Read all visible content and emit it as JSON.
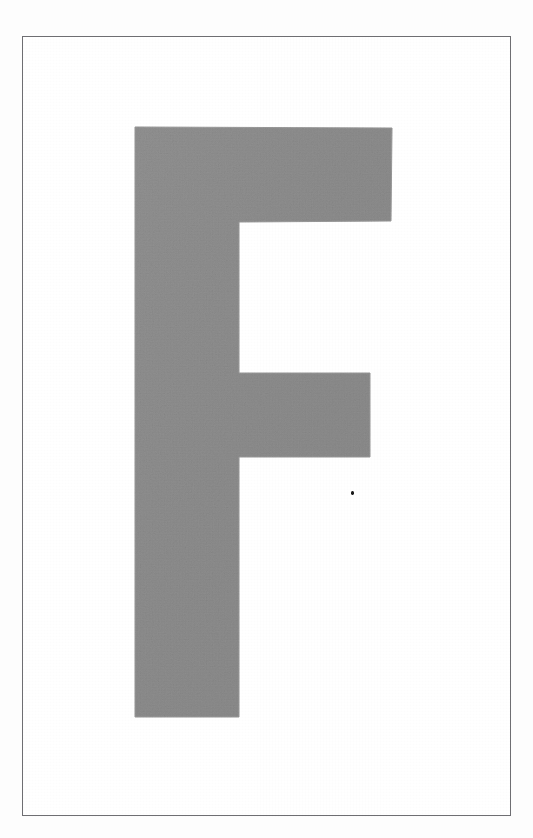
{
  "page": {
    "kind": "scanned-card",
    "width": 533,
    "height": 838,
    "outer_background_color": "#fdfdfd",
    "card_background_color": "#ffffff"
  },
  "frame": {
    "name": "border-rule",
    "x": 22,
    "y": 36,
    "width": 489,
    "height": 780,
    "stroke_color": "#6e6e72",
    "stroke_width": 1
  },
  "glyph": {
    "character": "F",
    "label": "letter-f",
    "fill_color": "#8d8d8d",
    "edge_color": "#9a9a9a",
    "bounds": {
      "x": 134,
      "y": 126,
      "width": 257,
      "height": 590
    },
    "parts": [
      {
        "name": "stem",
        "x": 134,
        "y": 126,
        "width": 104,
        "height": 590
      },
      {
        "name": "top-arm",
        "x": 134,
        "y": 126,
        "width": 257,
        "height": 94
      },
      {
        "name": "middle-arm",
        "x": 134,
        "y": 372,
        "width": 235,
        "height": 84
      }
    ],
    "outline_points": "134,126 391,127 390,220 238,221 238,372 369,372 369,456 238,456 238,716 134,716"
  },
  "artifacts": {
    "ink_speck": {
      "name": "ink-speck",
      "x": 350,
      "y": 490,
      "width": 3,
      "height": 4,
      "color": "#181818"
    }
  }
}
